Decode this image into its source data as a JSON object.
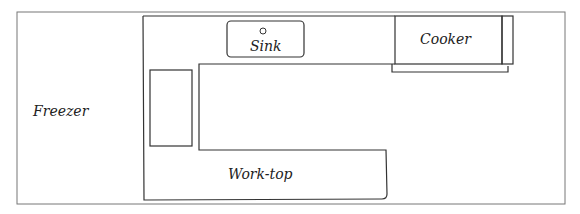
{
  "diagram": {
    "type": "kitchen-floor-plan",
    "labels": {
      "freezer": "Freezer",
      "sink": "Sink",
      "cooker": "Cooker",
      "worktop": "Work-top"
    },
    "colors": {
      "line": "#333333",
      "frame": "#777777",
      "text": "#222222",
      "background": "#ffffff"
    }
  }
}
